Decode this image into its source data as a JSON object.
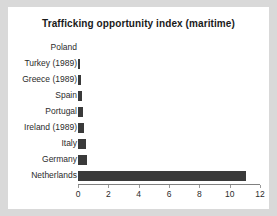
{
  "colors": {
    "page_background": "#d9d9d9",
    "panel_background": "#ffffff",
    "bar": "#3a3a3a",
    "axis": "#808080",
    "text": "#2b2b2b"
  },
  "chart_data": {
    "type": "bar",
    "orientation": "horizontal",
    "title": "Trafficking opportunity index (maritime)",
    "xlabel": "",
    "ylabel": "",
    "categories": [
      "Poland",
      "Turkey (1989)",
      "Greece (1989)",
      "Spain",
      "Portugal",
      "Ireland (1989)",
      "Italy",
      "Germany",
      "Netherlands"
    ],
    "values": [
      0,
      0.1,
      0.2,
      0.25,
      0.3,
      0.4,
      0.5,
      0.6,
      11.1
    ],
    "xlim": [
      0,
      12
    ],
    "xticks": [
      0,
      2,
      4,
      6,
      8,
      10,
      12
    ],
    "xtick_labels": [
      "0",
      "2",
      "4",
      "6",
      "8",
      "10",
      "12"
    ],
    "grid": false,
    "legend": false
  }
}
